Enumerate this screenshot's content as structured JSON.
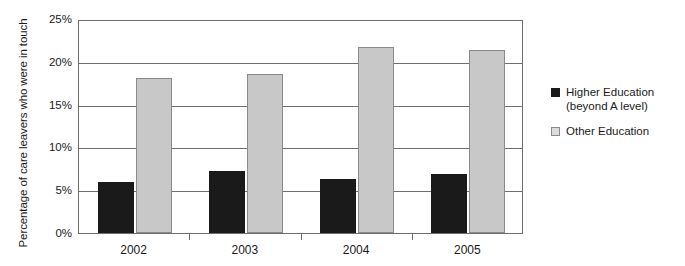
{
  "chart_data": {
    "type": "bar",
    "title": "",
    "subtitle": "",
    "xlabel": "",
    "ylabel": "Percentage of care leavers who were in touch",
    "categories": [
      "2002",
      "2003",
      "2004",
      "2005"
    ],
    "series": [
      {
        "name": "Higher Education (beyond A level)",
        "name_line1": "Higher Education",
        "name_line2": "(beyond A level)",
        "color": "#1a1a1a",
        "values": [
          6.0,
          7.2,
          6.3,
          6.9
        ]
      },
      {
        "name": "Other Education",
        "name_line1": "Other Education",
        "name_line2": "",
        "color": "#c8c8c8",
        "values": [
          18.1,
          18.6,
          21.7,
          21.4
        ]
      }
    ],
    "ylim": [
      0,
      25
    ],
    "ytick_values": [
      0,
      5,
      10,
      15,
      20,
      25
    ],
    "ytick_labels": [
      "0%",
      "5%",
      "10%",
      "15%",
      "20%",
      "25%"
    ],
    "grid": true,
    "legend_position": "right",
    "plot_background": "#ffffff",
    "axis_color": "#6e6e6e"
  }
}
